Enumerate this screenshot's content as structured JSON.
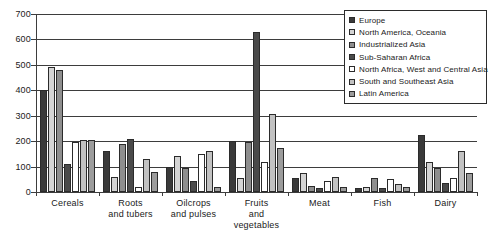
{
  "chart_data": {
    "type": "bar",
    "title": "",
    "xlabel": "",
    "ylabel": "",
    "ylim": [
      0,
      700
    ],
    "yticks": [
      0,
      100,
      200,
      300,
      400,
      500,
      600,
      700
    ],
    "grid": true,
    "legend_position": "top-right",
    "categories": [
      "Cereals",
      "Roots and tubers",
      "Oilcrops and pulses",
      "Fruits and vegetables",
      "Meat",
      "Fish",
      "Dairy"
    ],
    "series": [
      {
        "name": "Europe",
        "color": "#3a3a3a",
        "values": [
          400,
          160,
          100,
          200,
          55,
          15,
          225
        ]
      },
      {
        "name": "North America, Oceania",
        "color": "#d4d4d4",
        "values": [
          490,
          60,
          140,
          55,
          75,
          20,
          120
        ]
      },
      {
        "name": "Industrialized Asia",
        "color": "#8e8e8e",
        "values": [
          480,
          190,
          95,
          195,
          25,
          55,
          95
        ]
      },
      {
        "name": "Sub-Saharan Africa",
        "color": "#4a4a4a",
        "values": [
          110,
          210,
          45,
          630,
          15,
          15,
          35
        ]
      },
      {
        "name": "North Africa, West and Central Asia",
        "color": "#ffffff",
        "values": [
          195,
          20,
          150,
          120,
          45,
          50,
          55
        ]
      },
      {
        "name": "South and Southeast Asia",
        "color": "#c2c2c2",
        "values": [
          205,
          130,
          160,
          305,
          60,
          30,
          160
        ]
      },
      {
        "name": "Latin America",
        "color": "#9c9c9c",
        "values": [
          205,
          80,
          20,
          175,
          20,
          20,
          75
        ]
      }
    ]
  },
  "legend": {
    "items": [
      {
        "label": "Europe"
      },
      {
        "label": "North America, Oceania"
      },
      {
        "label": "Industrialized Asia"
      },
      {
        "label": "Sub-Saharan Africa"
      },
      {
        "label": "North Africa, West and Central Asia"
      },
      {
        "label": "South and Southeast Asia"
      },
      {
        "label": "Latin America"
      }
    ]
  }
}
